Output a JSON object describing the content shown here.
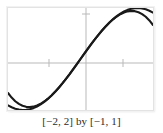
{
  "figure": {
    "caption": "[−2, 2] by [−1, 1]",
    "frame_color": "#e3e3e3",
    "axis_color": "#b9b9b9",
    "curve_color": "#1a1a1a",
    "background": "#ffffff"
  },
  "chart_data": {
    "type": "line",
    "title": "",
    "subtitle": "",
    "xlabel": "",
    "ylabel": "",
    "caption": "[−2, 2] by [−1, 1]",
    "xlim": [
      -2,
      2
    ],
    "ylim": [
      -1,
      1
    ],
    "xticks": [
      -1,
      1
    ],
    "yticks": [],
    "xticklabels": [
      "",
      ""
    ],
    "yticklabels": [],
    "grid": false,
    "legend": false,
    "legend_position": "none",
    "axes_drawn": [
      "x-axis",
      "y-axis"
    ],
    "series": [
      {
        "name": "sin x",
        "color": "#1a1a1a",
        "x": [
          -2.0,
          -1.9,
          -1.8,
          -1.7,
          -1.6,
          -1.5,
          -1.4,
          -1.3,
          -1.2,
          -1.1,
          -1.0,
          -0.9,
          -0.8,
          -0.7,
          -0.6,
          -0.5,
          -0.4,
          -0.3,
          -0.2,
          -0.1,
          0.0,
          0.1,
          0.2,
          0.3,
          0.4,
          0.5,
          0.6,
          0.7,
          0.8,
          0.9,
          1.0,
          1.1,
          1.2,
          1.3,
          1.4,
          1.5,
          1.6,
          1.7,
          1.8,
          1.9,
          2.0
        ],
        "values": [
          -0.909,
          -0.946,
          -0.974,
          -0.992,
          -1.0,
          -0.997,
          -0.985,
          -0.964,
          -0.932,
          -0.891,
          -0.841,
          -0.783,
          -0.717,
          -0.644,
          -0.565,
          -0.479,
          -0.389,
          -0.296,
          -0.199,
          -0.1,
          0.0,
          0.1,
          0.199,
          0.296,
          0.389,
          0.479,
          0.565,
          0.644,
          0.717,
          0.783,
          0.841,
          0.891,
          0.932,
          0.964,
          0.985,
          0.997,
          1.0,
          0.992,
          0.974,
          0.946,
          0.909
        ]
      },
      {
        "name": "x − x³/6",
        "color": "#1a1a1a",
        "x": [
          -2.0,
          -1.9,
          -1.8,
          -1.7,
          -1.6,
          -1.5,
          -1.4,
          -1.3,
          -1.2,
          -1.1,
          -1.0,
          -0.9,
          -0.8,
          -0.7,
          -0.6,
          -0.5,
          -0.4,
          -0.3,
          -0.2,
          -0.1,
          0.0,
          0.1,
          0.2,
          0.3,
          0.4,
          0.5,
          0.6,
          0.7,
          0.8,
          0.9,
          1.0,
          1.1,
          1.2,
          1.3,
          1.4,
          1.5,
          1.6,
          1.7,
          1.8,
          1.9,
          2.0
        ],
        "values": [
          -0.667,
          -0.757,
          -0.828,
          -0.881,
          -0.917,
          -0.938,
          -0.943,
          -0.934,
          -0.912,
          -0.878,
          -0.833,
          -0.778,
          -0.715,
          -0.643,
          -0.564,
          -0.479,
          -0.389,
          -0.296,
          -0.199,
          -0.1,
          0.0,
          0.1,
          0.199,
          0.296,
          0.389,
          0.479,
          0.564,
          0.643,
          0.715,
          0.778,
          0.833,
          0.878,
          0.912,
          0.934,
          0.943,
          0.938,
          0.917,
          0.881,
          0.828,
          0.757,
          0.667
        ]
      }
    ]
  }
}
